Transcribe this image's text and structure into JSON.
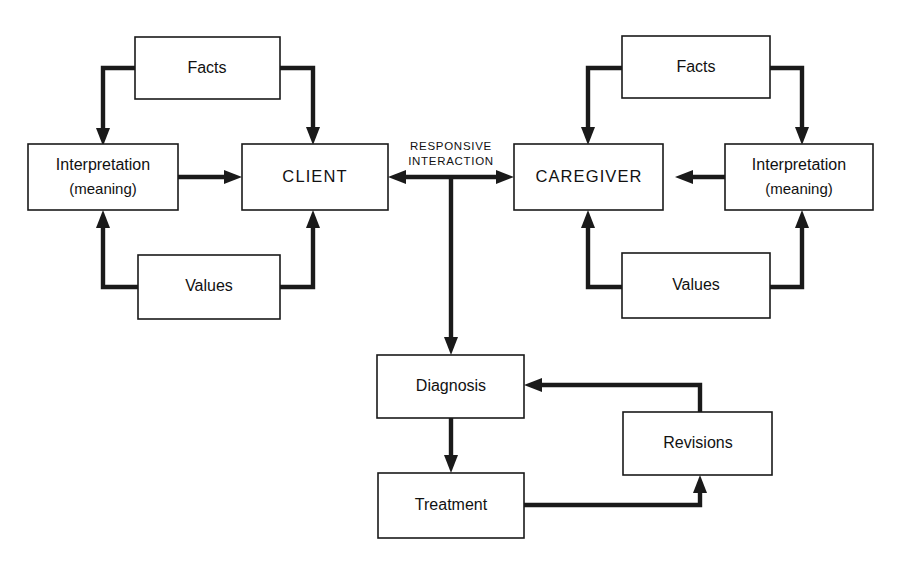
{
  "diagram": {
    "title": "Responsive Interaction",
    "center_label_line1": "RESPONSIVE",
    "center_label_line2": "INTERACTION",
    "colors": {
      "background": "#ffffff",
      "stroke": "#1a1a1a",
      "box_fill": "#ffffff",
      "text": "#111111"
    },
    "nodes": {
      "client_facts": {
        "label": "Facts"
      },
      "client_interpretation": {
        "label": "Interpretation",
        "sublabel": "(meaning)"
      },
      "client_values": {
        "label": "Values"
      },
      "client": {
        "label": "CLIENT"
      },
      "caregiver_facts": {
        "label": "Facts"
      },
      "caregiver_interpretation": {
        "label": "Interpretation",
        "sublabel": "(meaning)"
      },
      "caregiver_values": {
        "label": "Values"
      },
      "caregiver": {
        "label": "CAREGIVER"
      },
      "diagnosis": {
        "label": "Diagnosis"
      },
      "treatment": {
        "label": "Treatment"
      },
      "revisions": {
        "label": "Revisions"
      }
    },
    "edges": [
      {
        "name": "client-facts-to-interpretation",
        "from": "client_facts",
        "to": "client_interpretation",
        "direction": "one-way"
      },
      {
        "name": "client-facts-to-client",
        "from": "client_facts",
        "to": "client",
        "direction": "one-way"
      },
      {
        "name": "client-values-to-interpretation",
        "from": "client_values",
        "to": "client_interpretation",
        "direction": "one-way"
      },
      {
        "name": "client-values-to-client",
        "from": "client_values",
        "to": "client",
        "direction": "one-way"
      },
      {
        "name": "client-interpretation-to-client",
        "from": "client_interpretation",
        "to": "client",
        "direction": "one-way"
      },
      {
        "name": "caregiver-facts-to-caregiver",
        "from": "caregiver_facts",
        "to": "caregiver",
        "direction": "one-way"
      },
      {
        "name": "caregiver-facts-to-interpretation",
        "from": "caregiver_facts",
        "to": "caregiver_interpretation",
        "direction": "one-way"
      },
      {
        "name": "caregiver-values-to-caregiver",
        "from": "caregiver_values",
        "to": "caregiver",
        "direction": "one-way"
      },
      {
        "name": "caregiver-values-to-interpretation",
        "from": "caregiver_values",
        "to": "caregiver_interpretation",
        "direction": "one-way"
      },
      {
        "name": "caregiver-interpretation-to-caregiver",
        "from": "caregiver_interpretation",
        "to": "caregiver",
        "direction": "one-way"
      },
      {
        "name": "client-caregiver-responsive-interaction",
        "from": "client",
        "to": "caregiver",
        "direction": "two-way"
      },
      {
        "name": "interaction-to-diagnosis",
        "from": "client_caregiver_interaction",
        "to": "diagnosis",
        "direction": "one-way"
      },
      {
        "name": "diagnosis-to-treatment",
        "from": "diagnosis",
        "to": "treatment",
        "direction": "one-way"
      },
      {
        "name": "treatment-to-revisions",
        "from": "treatment",
        "to": "revisions",
        "direction": "one-way"
      },
      {
        "name": "revisions-to-diagnosis",
        "from": "revisions",
        "to": "diagnosis",
        "direction": "one-way"
      }
    ]
  }
}
